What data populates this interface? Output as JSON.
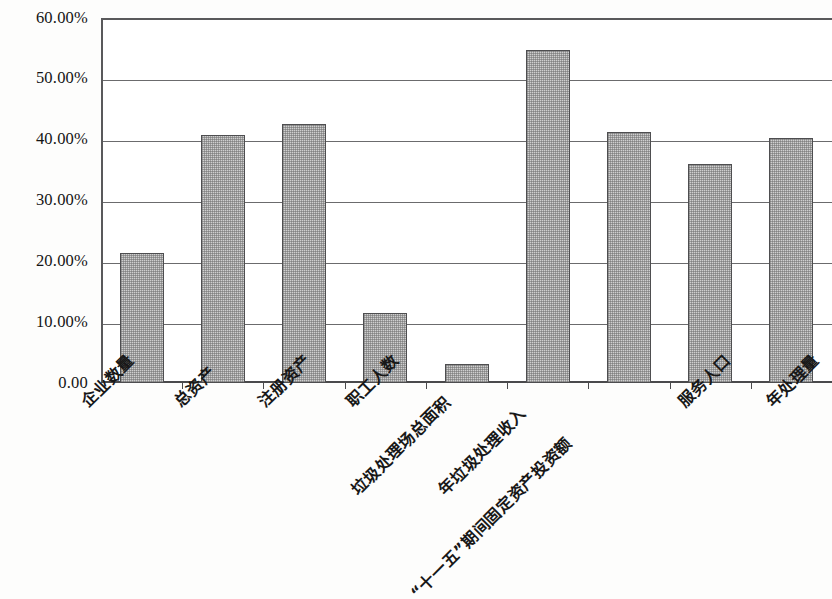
{
  "chart_data": {
    "type": "bar",
    "title": "",
    "subtitle": "",
    "xlabel": "",
    "ylabel": "",
    "ylim": [
      0,
      0.6
    ],
    "grid": true,
    "legend": false,
    "y_tick_labels": [
      "60.00%",
      "50.00%",
      "40.00%",
      "30.00%",
      "20.00%",
      "10.00%",
      "0.00"
    ],
    "y_tick_values": [
      0.6,
      0.5,
      0.4,
      0.3,
      0.2,
      0.1,
      0.0
    ],
    "categories": [
      "企业数量",
      "总资产",
      "注册资产",
      "职工人数",
      "垃圾处理场总面积",
      "年垃圾处理收入",
      "“十一五”期间固定资产投资额",
      "服务人口",
      "年处理量"
    ],
    "values": [
      0.2145,
      0.4082,
      0.4262,
      0.1148,
      0.0312,
      0.5475,
      0.4131,
      0.3607,
      0.4033
    ],
    "value_labels": [
      "21.45%",
      "40.82%",
      "42.62%",
      "11.48%",
      "3.12%",
      "54.75%",
      "41.31%",
      "36.07%",
      "40.33%"
    ],
    "series": [
      {
        "name": "占比",
        "values": [
          0.2145,
          0.4082,
          0.4262,
          0.1148,
          0.0312,
          0.5475,
          0.4131,
          0.3607,
          0.4033
        ]
      }
    ],
    "bar_fill_color": "#cfcfcf",
    "bar_border_color": "#4e4e50",
    "gridline_color": "#6b6b6d",
    "axis_color": "#4a4a4c",
    "background_color": "#ffffff"
  }
}
